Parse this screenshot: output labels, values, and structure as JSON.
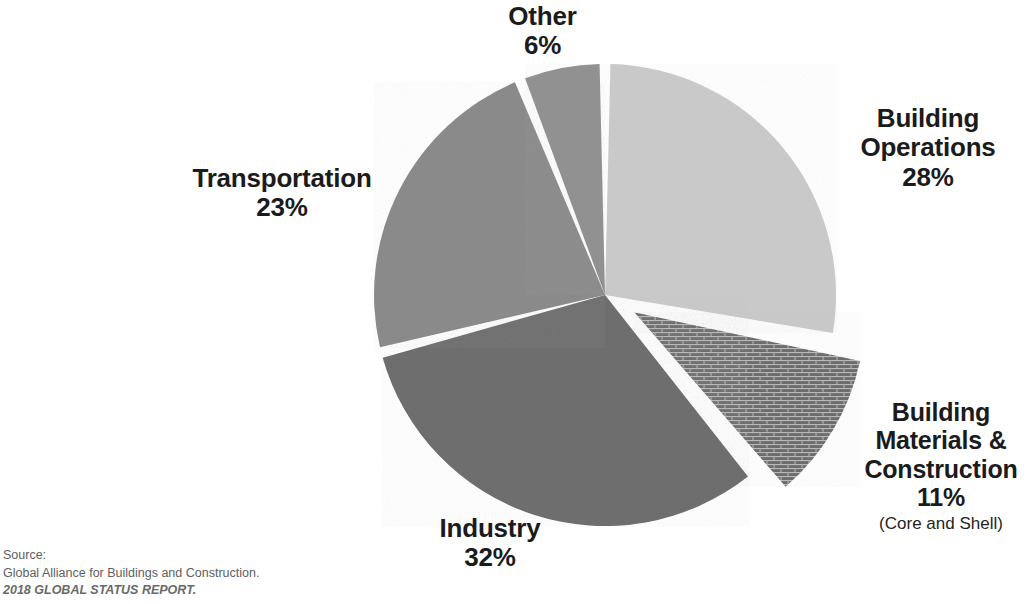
{
  "chart_data": {
    "type": "pie",
    "title": "",
    "subtitle": "",
    "xlabel": "",
    "ylabel": "",
    "legend_position": "none",
    "grid": false,
    "units": "percent",
    "total": 100,
    "start_angle_deg": 0,
    "direction": "clockwise",
    "categories": [
      "Building Operations",
      "Building Materials & Construction",
      "Industry",
      "Transportation",
      "Other"
    ],
    "values": [
      28,
      11,
      32,
      23,
      6
    ],
    "slices": [
      {
        "name": "Building Operations",
        "label": "Building\nOperations",
        "value": 28,
        "pct_text": "28%",
        "color": "#c9c9c9",
        "pattern": "solid",
        "exploded": false,
        "sublabel": ""
      },
      {
        "name": "Building Materials & Construction",
        "label": "Building\nMaterials &\nConstruction",
        "value": 11,
        "pct_text": "11%",
        "color": "#6d6d6d",
        "pattern": "brick",
        "exploded": true,
        "sublabel": "(Core and Shell)"
      },
      {
        "name": "Industry",
        "label": "Industry",
        "value": 32,
        "pct_text": "32%",
        "color": "#6e6e6e",
        "pattern": "solid",
        "exploded": false,
        "sublabel": ""
      },
      {
        "name": "Transportation",
        "label": "Transportation",
        "value": 23,
        "pct_text": "23%",
        "color": "#8a8a8a",
        "pattern": "solid",
        "exploded": false,
        "sublabel": ""
      },
      {
        "name": "Other",
        "label": "Other",
        "value": 6,
        "pct_text": "6%",
        "color": "#919191",
        "pattern": "solid",
        "exploded": false,
        "sublabel": ""
      }
    ]
  },
  "labels": {
    "other": {
      "name": "Other",
      "pct": "6%"
    },
    "building_operations": {
      "name": "Building\nOperations",
      "pct": "28%"
    },
    "transportation": {
      "name": "Transportation",
      "pct": "23%"
    },
    "industry": {
      "name": "Industry",
      "pct": "32%"
    },
    "building_materials": {
      "name": "Building\nMaterials &\nConstruction",
      "pct": "11%",
      "sub": "(Core and Shell)"
    }
  },
  "source": {
    "line1": "Source:",
    "line2": "Global Alliance for Buildings and Construction.",
    "line3": "2018 GLOBAL STATUS REPORT."
  },
  "colors": {
    "background": "#ffffff",
    "text": "#1b1b1b",
    "source_text": "#5e5e5e",
    "slice_separator": "#ffffff",
    "light_gray": "#c9c9c9",
    "medium_gray": "#8a8a8a",
    "medium_light_gray": "#919191",
    "dark_gray": "#6e6e6e",
    "brick_base": "#6d6d6d",
    "brick_mortar": "#b4b4b4"
  }
}
